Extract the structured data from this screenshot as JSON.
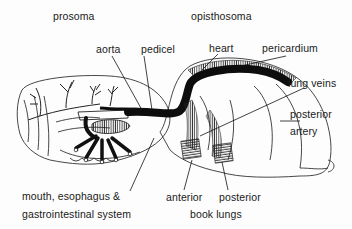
{
  "diagram": {
    "regions": {
      "prosoma": "prosoma",
      "opisthosoma": "opisthosoma"
    },
    "labels": {
      "aorta": "aorta",
      "pedicel": "pedicel",
      "heart": "heart",
      "pericardium": "pericardium",
      "lung_veins": "lung veins",
      "posterior_artery_1": "posterior",
      "posterior_artery_2": "artery",
      "mouth_line1": "mouth, esophagus &",
      "mouth_line2": "gastrointestinal  system",
      "anterior": "anterior",
      "posterior": "posterior",
      "book_lungs": "book  lungs"
    },
    "colors": {
      "ink": "#111111",
      "outline": "#333333",
      "background": "#fdfdfd"
    }
  }
}
